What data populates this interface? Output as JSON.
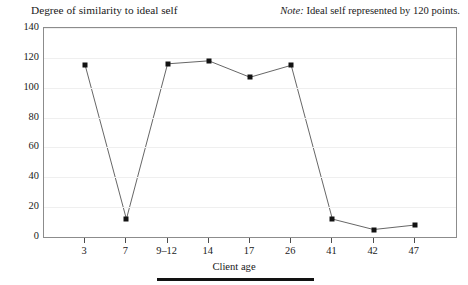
{
  "header": {
    "y_axis_title": "Degree of similarity to ideal self",
    "note_label": "Note:",
    "note_text": " Ideal self represented by 120 points."
  },
  "axis": {
    "x_title": "Client age"
  },
  "chart_data": {
    "type": "line",
    "title": "Degree of similarity to ideal self",
    "xlabel": "Client age",
    "ylabel": "Degree of similarity to ideal self",
    "annotation": "Note: Ideal self represented by 120 points.",
    "categories": [
      "3",
      "7",
      "9–12",
      "14",
      "17",
      "26",
      "41",
      "42",
      "47"
    ],
    "values": [
      115,
      12,
      116,
      118,
      107,
      115,
      12,
      5,
      8
    ],
    "ylim": [
      0,
      140
    ],
    "yticks": [
      0,
      20,
      40,
      60,
      80,
      100,
      120,
      140
    ],
    "grid": true,
    "legend": "none",
    "marker": "square",
    "line_color": "#555555",
    "marker_color": "#121212"
  }
}
